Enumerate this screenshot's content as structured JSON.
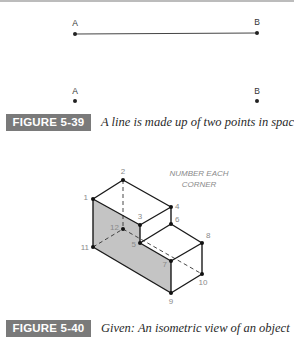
{
  "figure_5_39": {
    "label": "FIGURE 5-39",
    "caption": "A line is made up of two points in space",
    "top_pair": {
      "left_label": "A",
      "right_label": "B",
      "connected": true
    },
    "bottom_pair": {
      "left_label": "A",
      "right_label": "B",
      "connected": false
    }
  },
  "figure_5_40": {
    "label": "FIGURE 5-40",
    "caption": "Given: An isometric view of an object",
    "note_line1": "NUMBER EACH",
    "note_line2": "CORNER",
    "corners": [
      "1",
      "2",
      "3",
      "4",
      "5",
      "6",
      "7",
      "8",
      "9",
      "10",
      "11",
      "12"
    ]
  },
  "colors": {
    "label_bg": "#7a7a7a",
    "label_text": "#ffffff",
    "shaded_face": "#c4c4c4",
    "line": "#1a1a1a",
    "number_text": "#8a8a8a"
  }
}
